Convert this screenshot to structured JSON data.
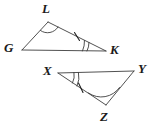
{
  "figure": {
    "width": 159,
    "height": 129,
    "background_color": "#ffffff",
    "line_color": "#3d3d3d",
    "label_color": "#1a1a1a"
  },
  "triangles": [
    {
      "name": "triangle-GLK",
      "vertices": [
        {
          "label": "G",
          "x": 22,
          "y": 50,
          "label_x": 4,
          "label_y": 41
        },
        {
          "label": "L",
          "x": 48,
          "y": 22,
          "label_x": 42,
          "label_y": 2
        },
        {
          "label": "K",
          "x": 106,
          "y": 51,
          "label_x": 110,
          "label_y": 43
        }
      ],
      "angle_marks": [
        {
          "vertex": "L",
          "arcs": 1,
          "name": "angle-arc-L"
        },
        {
          "vertex": "K",
          "arcs": 2,
          "name": "angle-arc-K"
        }
      ],
      "side_ticks": [
        {
          "side": "LK",
          "ticks": 1,
          "name": "tick-mark-LK"
        }
      ]
    },
    {
      "name": "triangle-XYZ",
      "vertices": [
        {
          "label": "X",
          "x": 58,
          "y": 73,
          "label_x": 43,
          "label_y": 64
        },
        {
          "label": "Y",
          "x": 134,
          "y": 71,
          "label_x": 138,
          "label_y": 62
        },
        {
          "label": "Z",
          "x": 106,
          "y": 105,
          "label_x": 100,
          "label_y": 110
        }
      ],
      "angle_marks": [
        {
          "vertex": "X",
          "arcs": 2,
          "name": "angle-arc-X"
        },
        {
          "vertex": "Z",
          "arcs": 1,
          "name": "angle-arc-Z"
        }
      ],
      "side_ticks": [
        {
          "side": "XZ",
          "ticks": 1,
          "name": "tick-mark-XZ"
        }
      ]
    }
  ]
}
